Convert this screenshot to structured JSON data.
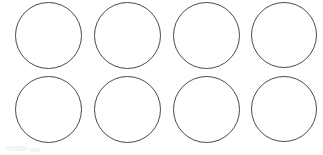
{
  "page": {
    "background_color": "#ffffff",
    "width": 323,
    "height": 155
  },
  "grid": {
    "name": "circle-template-grid",
    "rows": 2,
    "columns": 4,
    "count": 8,
    "shape": "circle",
    "stroke_color": "#4a4a52",
    "stroke_width_px": 1,
    "fill_color": "#ffffff",
    "diameter_px": 67,
    "column_pitch_px": 79,
    "row_pitch_px": 74,
    "circles": [
      {
        "id": "circle-r1c1",
        "row": 1,
        "column": 1,
        "x": 15,
        "y": 2,
        "size": 67,
        "label": ""
      },
      {
        "id": "circle-r1c2",
        "row": 1,
        "column": 2,
        "x": 94,
        "y": 2,
        "size": 67,
        "label": ""
      },
      {
        "id": "circle-r1c3",
        "row": 1,
        "column": 3,
        "x": 173,
        "y": 2,
        "size": 67,
        "label": ""
      },
      {
        "id": "circle-r1c4",
        "row": 1,
        "column": 4,
        "x": 251,
        "y": 2,
        "size": 66,
        "label": ""
      },
      {
        "id": "circle-r2c1",
        "row": 2,
        "column": 1,
        "x": 15,
        "y": 76,
        "size": 67,
        "label": ""
      },
      {
        "id": "circle-r2c2",
        "row": 2,
        "column": 2,
        "x": 94,
        "y": 76,
        "size": 67,
        "label": ""
      },
      {
        "id": "circle-r2c3",
        "row": 2,
        "column": 3,
        "x": 173,
        "y": 76,
        "size": 67,
        "label": ""
      },
      {
        "id": "circle-r2c4",
        "row": 2,
        "column": 4,
        "x": 251,
        "y": 76,
        "size": 66,
        "label": ""
      }
    ]
  },
  "artifacts": [
    {
      "id": "smudge-lower-left",
      "x": 6,
      "y": 146,
      "width": 22,
      "height": 5
    },
    {
      "id": "smudge-lower-left-2",
      "x": 30,
      "y": 148,
      "width": 10,
      "height": 4
    }
  ]
}
